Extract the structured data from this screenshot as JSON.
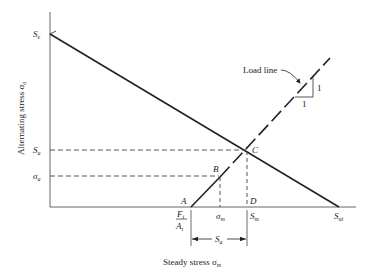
{
  "diagram": {
    "type": "fatigue-load-line-diagram",
    "x_axis_label": "Steady stress σ",
    "x_axis_label_sub": "m",
    "y_axis_label": "Alternating stress σ",
    "y_axis_label_sub": "a",
    "y_ticks": {
      "Se": {
        "main": "S",
        "sub": "e"
      },
      "Sa": {
        "main": "S",
        "sub": "a"
      },
      "sigma_a": {
        "main": "σ",
        "sub": "a"
      }
    },
    "x_ticks": {
      "Fi_num": {
        "main": "F",
        "sub": "i"
      },
      "Ai_den": {
        "main": "A",
        "sub": "t"
      },
      "sigma_m": {
        "main": "σ",
        "sub": "m"
      },
      "Sm": {
        "main": "S",
        "sub": "m"
      },
      "Sut": {
        "main": "S",
        "sub": "ut"
      }
    },
    "points": {
      "A": "A",
      "B": "B",
      "C": "C",
      "D": "D"
    },
    "dimension": {
      "main": "S",
      "sub": "a"
    },
    "load_line_label": "Load line",
    "slope_rise": "1",
    "slope_run": "1"
  }
}
